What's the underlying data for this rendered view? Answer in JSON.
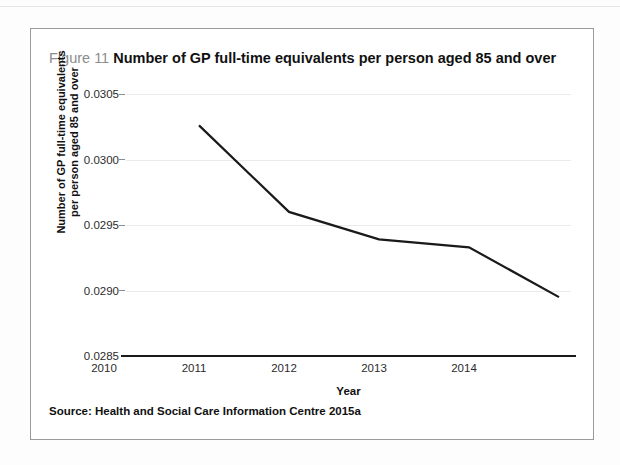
{
  "figure": {
    "number": "Figure 11",
    "title": "Number of GP full-time equivalents per person aged 85 and over",
    "source": "Source: Health and Social Care Information Centre 2015a",
    "border_color": "#9a9a9a",
    "number_color": "#8d8d8d"
  },
  "chart_data": {
    "type": "line",
    "title": "Number of GP full-time equivalents per person aged 85 and over",
    "categories": [
      "2010",
      "2011",
      "2012",
      "2013",
      "2014"
    ],
    "values": [
      0.03026,
      0.0296,
      0.02939,
      0.02933,
      0.02895
    ],
    "series": [
      {
        "name": "Number of GP full-time equivalents per person aged 85 and over",
        "values": [
          0.03026,
          0.0296,
          0.02939,
          0.02933,
          0.02895
        ],
        "color": "#1a1a1a"
      }
    ],
    "xlabel": "Year",
    "ylabel": "Number of GP full-time equivalents per person aged 85 and over",
    "ylabel_line1": "Number of GP full-time equivalents",
    "ylabel_line2": "per person aged 85 and over",
    "ylim": [
      0.0285,
      0.0305
    ],
    "yticks": [
      "0.0285",
      "0.0290",
      "0.0295",
      "0.0300",
      "0.0305"
    ],
    "ytick_values": [
      0.0285,
      0.029,
      0.0295,
      0.03,
      0.0305
    ],
    "xticks": [
      "2010",
      "2011",
      "2012",
      "2013",
      "2014"
    ],
    "grid": true,
    "grid_color": "#ebebeb",
    "legend": "none",
    "markers": false,
    "line_width": 2
  }
}
